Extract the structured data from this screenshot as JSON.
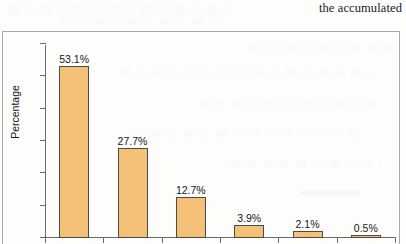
{
  "document": {
    "header_text": "the accumulated"
  },
  "chart_data": {
    "type": "bar",
    "title": "",
    "xlabel": "",
    "ylabel": "Percentage",
    "ylim": [
      0,
      60
    ],
    "ytick_labels": [
      "0",
      "10",
      "20",
      "30",
      "40",
      "50",
      "60"
    ],
    "yticks": [
      0,
      10,
      20,
      30,
      40,
      50,
      60
    ],
    "grid": false,
    "legend": "none",
    "categories": [
      "1",
      "2",
      "3",
      "4",
      "5",
      "6"
    ],
    "values": [
      53.1,
      27.7,
      12.7,
      3.9,
      2.1,
      0.5
    ],
    "data_labels": [
      "53.1%",
      "27.7%",
      "12.7%",
      "3.9%",
      "2.1%",
      "0.5%"
    ],
    "colors": {
      "bar_fill": "#f5c077",
      "bar_edge": "#4a4a4c",
      "axis": "#6a6a6c",
      "text": "#16161a",
      "frame": "#a9a9ab",
      "background": "#fdfdfc"
    }
  }
}
